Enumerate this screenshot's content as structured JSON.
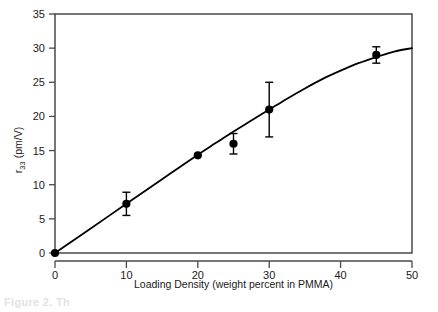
{
  "figure": {
    "caption_partial": "Figure 2.  Th",
    "y_axis_label_main": "r",
    "y_axis_label_sub": "33",
    "y_axis_label_units": " (pm/V)"
  },
  "chart_data": {
    "type": "scatter",
    "title": "",
    "xlabel": "Loading Density (weight percent in PMMA)",
    "ylabel": "r33 (pm/V)",
    "xlim": [
      0,
      50
    ],
    "ylim": [
      0,
      35
    ],
    "xticks": [
      0,
      10,
      20,
      30,
      40,
      50
    ],
    "yticks": [
      0,
      5,
      10,
      15,
      20,
      25,
      30,
      35
    ],
    "xtick_labels": [
      "0",
      "10",
      "20",
      "30",
      "40",
      "50"
    ],
    "ytick_labels": [
      "0",
      "5",
      "10",
      "15",
      "20",
      "25",
      "30",
      "35"
    ],
    "grid": false,
    "legend": null,
    "marker": "filled-circle",
    "marker_color": "#000000",
    "line_color": "#000000",
    "points": [
      {
        "x": 0,
        "y": 0.0,
        "yerr": 0.0
      },
      {
        "x": 10,
        "y": 7.2,
        "yerr": 1.7
      },
      {
        "x": 20,
        "y": 14.3,
        "yerr": 0.0
      },
      {
        "x": 25,
        "y": 16.0,
        "yerr": 1.5
      },
      {
        "x": 30,
        "y": 21.0,
        "yerr": 4.0
      },
      {
        "x": 45,
        "y": 29.0,
        "yerr": 1.2
      }
    ],
    "fit_curve": {
      "name": "model-fit",
      "x": [
        0,
        2.5,
        5,
        7.5,
        10,
        12.5,
        15,
        17.5,
        20,
        22.5,
        25,
        27.5,
        30,
        32.5,
        35,
        37.5,
        40,
        42.5,
        45,
        47.5,
        50
      ],
      "y": [
        0.0,
        1.8,
        3.6,
        5.4,
        7.2,
        9.0,
        10.8,
        12.6,
        14.4,
        16.1,
        17.8,
        19.4,
        21.0,
        22.6,
        24.1,
        25.5,
        26.7,
        27.8,
        28.7,
        29.5,
        30.0
      ]
    }
  }
}
